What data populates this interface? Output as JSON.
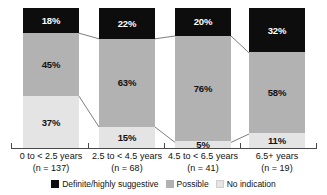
{
  "chart_data": {
    "type": "bar",
    "subtype": "100% stacked column",
    "title": "",
    "xlabel": "",
    "ylabel": "",
    "ylim": [
      0,
      100
    ],
    "grid": false,
    "legend_position": "bottom-center",
    "categories": [
      "0 to < 2.5 years",
      "2.5 to < 4.5 years",
      "4.5 to < 6.5 years",
      "6.5+ years"
    ],
    "category_counts": [
      "(n = 137)",
      "(n = 68)",
      "(n = 41)",
      "(n = 19)"
    ],
    "series": [
      {
        "name": "Definite/highly suggestive",
        "color": "#0d0d0d",
        "values": [
          18,
          22,
          20,
          32
        ],
        "labels": [
          "18%",
          "22%",
          "20%",
          "32%"
        ]
      },
      {
        "name": "Possible",
        "color": "#b2b2b2",
        "values": [
          45,
          63,
          76,
          58
        ],
        "labels": [
          "45%",
          "63%",
          "76%",
          "58%"
        ]
      },
      {
        "name": "No indication",
        "color": "#e4e4e4",
        "values": [
          37,
          15,
          5,
          11
        ],
        "labels": [
          "37%",
          "15%",
          "5%",
          "11%"
        ]
      }
    ]
  },
  "legend": {
    "items": [
      {
        "label": "Definite/highly suggestive"
      },
      {
        "label": "Possible"
      },
      {
        "label": "No indication"
      }
    ]
  },
  "colors": {
    "definite": "#0d0d0d",
    "possible": "#b2b2b2",
    "no_indication": "#e4e4e4",
    "axis": "#4a4a4a",
    "connector": "#6e6e6e",
    "background": "#ffffff"
  }
}
